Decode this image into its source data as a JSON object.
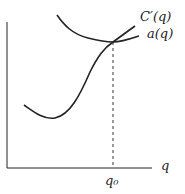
{
  "figure": {
    "type": "economics-cost-curves",
    "axes": {
      "x_label": "q",
      "y_label": "",
      "x_tick_label": "q₀"
    },
    "curves": [
      {
        "name": "marginal-cost",
        "label": "C′(q)",
        "shape": "U-shaped, rising steeply"
      },
      {
        "name": "average-cost",
        "label": "a(q)",
        "shape": "U-shaped, flat near minimum"
      }
    ],
    "annotation": "Curves intersect at q₀ (minimum of a(q)); dashed vertical line drops to axis",
    "colors": {
      "line": "#222222",
      "background": "#ffffff"
    }
  }
}
